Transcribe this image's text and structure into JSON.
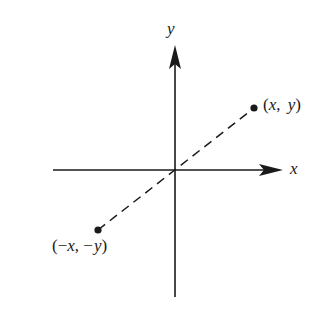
{
  "diagram": {
    "type": "coordinate-plane",
    "axes": {
      "x_label": "x",
      "y_label": "y"
    },
    "points": [
      {
        "id": "p1",
        "label": "(x, y)",
        "label_parts": [
          "(",
          "x",
          ", ",
          "y",
          ")"
        ]
      },
      {
        "id": "p2",
        "label": "(−x, −y)",
        "label_parts": [
          "(−",
          "x",
          ", −",
          "y",
          ")"
        ]
      }
    ],
    "connector": "dashed line through origin",
    "colors": {
      "ink": "#1a1a1a",
      "background": "#ffffff"
    }
  }
}
